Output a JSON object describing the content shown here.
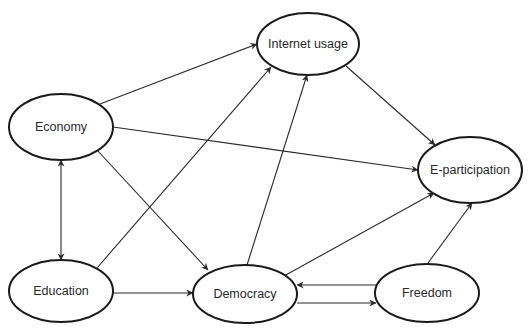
{
  "diagram": {
    "type": "path-model",
    "colors": {
      "stroke": "#1a1a1a",
      "edge": "#2a2a2a",
      "text": "#2a2a2a",
      "background": "#ffffff"
    },
    "nodes": [
      {
        "id": "internet_usage",
        "label": "Internet usage",
        "cx": 308,
        "cy": 44,
        "rx": 51,
        "ry": 31
      },
      {
        "id": "economy",
        "label": "Economy",
        "cx": 61,
        "cy": 127,
        "rx": 52,
        "ry": 33
      },
      {
        "id": "e_participation",
        "label": "E-participation",
        "cx": 470,
        "cy": 170,
        "rx": 52,
        "ry": 33
      },
      {
        "id": "education",
        "label": "Education",
        "cx": 61,
        "cy": 291,
        "rx": 52,
        "ry": 31
      },
      {
        "id": "democracy",
        "label": "Democracy",
        "cx": 245,
        "cy": 294,
        "rx": 52,
        "ry": 29
      },
      {
        "id": "freedom",
        "label": "Freedom",
        "cx": 427,
        "cy": 293,
        "rx": 52,
        "ry": 29
      }
    ],
    "edges": [
      {
        "from": "economy",
        "to": "internet_usage",
        "x1": 100,
        "y1": 104,
        "x2": 257,
        "y2": 44
      },
      {
        "from": "economy",
        "to": "e_participation",
        "x1": 113,
        "y1": 127,
        "x2": 418,
        "y2": 170
      },
      {
        "from": "economy",
        "to": "democracy",
        "x1": 97,
        "y1": 150,
        "x2": 208,
        "y2": 270
      },
      {
        "from": "economy",
        "to": "education",
        "x1": 61,
        "y1": 160,
        "x2": 61,
        "y2": 260,
        "bidirectional": true
      },
      {
        "from": "education",
        "to": "internet_usage",
        "x1": 97,
        "y1": 268,
        "x2": 271,
        "y2": 67
      },
      {
        "from": "education",
        "to": "democracy",
        "x1": 113,
        "y1": 293,
        "x2": 193,
        "y2": 293
      },
      {
        "from": "democracy",
        "to": "internet_usage",
        "x1": 247,
        "y1": 265,
        "x2": 307,
        "y2": 75
      },
      {
        "from": "internet_usage",
        "to": "e_participation",
        "x1": 346,
        "y1": 66,
        "x2": 435,
        "y2": 145
      },
      {
        "from": "democracy",
        "to": "e_participation",
        "x1": 284,
        "y1": 276,
        "x2": 434,
        "y2": 193
      },
      {
        "from": "freedom",
        "to": "e_participation",
        "x1": 428,
        "y1": 263,
        "x2": 472,
        "y2": 203
      },
      {
        "from": "freedom",
        "to": "democracy",
        "x1": 376,
        "y1": 285,
        "x2": 297,
        "y2": 285
      },
      {
        "from": "democracy",
        "to": "freedom",
        "x1": 297,
        "y1": 303,
        "x2": 376,
        "y2": 303
      }
    ]
  }
}
